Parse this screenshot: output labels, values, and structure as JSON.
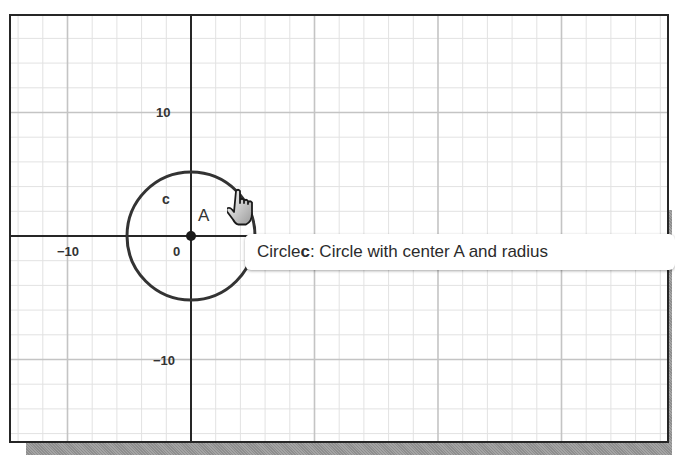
{
  "graphics_view": {
    "x_axis_labels": [
      "−10",
      "0"
    ],
    "y_axis_labels": [
      "10",
      "−10"
    ],
    "grid": {
      "major_step": 10,
      "minor_step": 2
    },
    "colors": {
      "axis": "#262626",
      "major_grid": "#c8c8c8",
      "minor_grid": "#e4e4e4",
      "circle": "#333333",
      "point": "#1a1a1a"
    }
  },
  "objects": {
    "circle": {
      "name": "c",
      "center": "A",
      "label": "c"
    },
    "point": {
      "name": "A",
      "label": "A"
    }
  },
  "tooltip": {
    "prefix": "Circle ",
    "object_name": "c",
    "description": ": Circle with center A and radius"
  },
  "cursor": {
    "icon": "hand-pointer-icon"
  }
}
